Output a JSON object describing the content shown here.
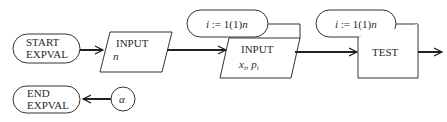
{
  "diagram": {
    "type": "flowchart",
    "nodes": [
      {
        "id": "start",
        "shape": "terminal",
        "lines": [
          "START",
          "EXPVAL"
        ]
      },
      {
        "id": "input_n",
        "shape": "parallelogram",
        "lines": [
          "INPUT",
          "n"
        ]
      },
      {
        "id": "loop1",
        "shape": "loop-pill",
        "label": "i := 1(1)n"
      },
      {
        "id": "input_xp",
        "shape": "parallelogram",
        "lines": [
          "INPUT",
          "x_i, p_i"
        ]
      },
      {
        "id": "loop2",
        "shape": "loop-pill",
        "label": "i := 1(1)n"
      },
      {
        "id": "test",
        "shape": "rectangle",
        "lines": [
          "TEST"
        ]
      },
      {
        "id": "end",
        "shape": "terminal",
        "lines": [
          "END",
          "EXPVAL"
        ]
      },
      {
        "id": "alpha",
        "shape": "connector",
        "label": "α"
      }
    ],
    "edges": [
      {
        "from": "start",
        "to": "input_n"
      },
      {
        "from": "input_n",
        "to": "input_xp"
      },
      {
        "from": "input_xp",
        "to": "test"
      },
      {
        "from": "test",
        "to": "off-page"
      },
      {
        "from": "alpha",
        "to": "end"
      }
    ]
  },
  "labels": {
    "start_l1": "START",
    "start_l2": "EXPVAL",
    "input_n_l1": "INPUT",
    "input_n_l2": "n",
    "loop1_i": "i",
    "loop1_rest": " := 1(1)",
    "loop1_n": "n",
    "input_xp_l1": "INPUT",
    "input_xp_x": "x",
    "input_xp_xi": "i",
    "input_xp_sep": ", ",
    "input_xp_p": "p",
    "input_xp_pi": "i",
    "loop2_i": "i",
    "loop2_rest": " := 1(1)",
    "loop2_n": "n",
    "test_l1": "TEST",
    "end_l1": "END",
    "end_l2": "EXPVAL",
    "alpha": "α"
  }
}
